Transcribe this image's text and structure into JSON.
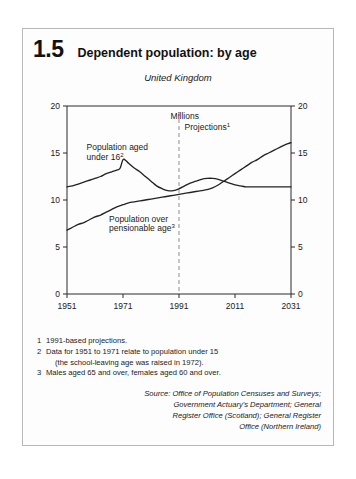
{
  "figure": {
    "number": "1.5",
    "title": "Dependent population: by age",
    "region": "United Kingdom"
  },
  "chart_data": {
    "type": "line",
    "title": "Dependent population: by age",
    "subtitle": "United Kingdom",
    "units_label": "Millions",
    "xlabel": "",
    "ylabel": "Millions",
    "xlim": [
      1951,
      2031
    ],
    "ylim": [
      0,
      20
    ],
    "x_ticks": [
      1951,
      1971,
      1991,
      2011,
      2031
    ],
    "y_ticks": [
      0,
      5,
      10,
      15,
      20
    ],
    "grid": false,
    "legend": "inline-annotations",
    "annotations": [
      {
        "text": "Millions",
        "x": 1988,
        "y": 18.6
      },
      {
        "text": "Projections",
        "sup": "1",
        "x": 1993,
        "y": 17.4
      },
      {
        "text": "Population aged",
        "x": 1958,
        "y": 15.3
      },
      {
        "text": "under 16",
        "sup": "2",
        "x": 1958,
        "y": 14.3
      },
      {
        "text": "Population over",
        "x": 1966,
        "y": 7.7
      },
      {
        "text": "pensionable age",
        "sup": "3",
        "x": 1966,
        "y": 6.7
      }
    ],
    "projection_divider_x": 1991,
    "series": [
      {
        "name": "Population aged under 16",
        "x": [
          1951,
          1953,
          1955,
          1957,
          1959,
          1961,
          1963,
          1965,
          1967,
          1969,
          1970,
          1971,
          1972,
          1973,
          1975,
          1977,
          1979,
          1981,
          1983,
          1985,
          1987,
          1989,
          1991,
          1993,
          1995,
          1997,
          1999,
          2001,
          2003,
          2005,
          2007,
          2009,
          2011,
          2013,
          2015,
          2017,
          2019,
          2021,
          2023,
          2025,
          2027,
          2029,
          2031
        ],
        "values": [
          11.4,
          11.5,
          11.7,
          11.9,
          12.1,
          12.3,
          12.5,
          12.8,
          13.0,
          13.2,
          13.4,
          14.3,
          14.2,
          13.9,
          13.4,
          13.0,
          12.5,
          12.0,
          11.5,
          11.2,
          11.0,
          11.0,
          11.2,
          11.5,
          11.8,
          12.0,
          12.2,
          12.3,
          12.3,
          12.2,
          12.0,
          11.8,
          11.6,
          11.5,
          11.4,
          11.4,
          11.4,
          11.4,
          11.4,
          11.4,
          11.4,
          11.4,
          11.4
        ]
      },
      {
        "name": "Population over pensionable age",
        "x": [
          1951,
          1953,
          1955,
          1957,
          1959,
          1961,
          1963,
          1965,
          1967,
          1969,
          1971,
          1973,
          1975,
          1977,
          1979,
          1981,
          1983,
          1985,
          1987,
          1989,
          1991,
          1993,
          1995,
          1997,
          1999,
          2001,
          2003,
          2005,
          2007,
          2009,
          2011,
          2013,
          2015,
          2017,
          2019,
          2021,
          2023,
          2025,
          2027,
          2029,
          2031
        ],
        "values": [
          6.8,
          7.1,
          7.4,
          7.6,
          7.9,
          8.2,
          8.4,
          8.7,
          9.0,
          9.3,
          9.5,
          9.7,
          9.8,
          9.9,
          10.0,
          10.1,
          10.2,
          10.3,
          10.4,
          10.5,
          10.6,
          10.7,
          10.8,
          10.9,
          11.0,
          11.1,
          11.3,
          11.6,
          12.0,
          12.4,
          12.8,
          13.2,
          13.6,
          14.0,
          14.3,
          14.7,
          15.0,
          15.3,
          15.6,
          15.9,
          16.1
        ]
      }
    ]
  },
  "footnotes": [
    {
      "num": "1",
      "text": "1991-based projections."
    },
    {
      "num": "2",
      "text": "Data for 1951 to 1971 relate to population under 15",
      "sub": "(the school-leaving age was raised in 1972)."
    },
    {
      "num": "3",
      "text": "Males aged 65 and over, females aged 60 and over."
    }
  ],
  "source": {
    "lines": [
      "Source: Office of Population Censuses and Surveys;",
      "Government Actuary's Department; General",
      "Register Office (Scotland); General Register",
      "Office (Northern Ireland)"
    ]
  },
  "colors": {
    "line": "#232323",
    "axis": "#2a2a2a",
    "divider": "#8e8e8e",
    "panel_border": "#b8b8b8"
  }
}
